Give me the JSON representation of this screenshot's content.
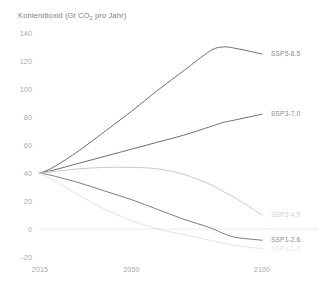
{
  "chart_data": {
    "type": "line",
    "title": "Kohlendioxid (Gt CO2 pro Jahr)",
    "title_main": "Kohlendioxid (Gt CO",
    "title_sub": "2",
    "title_tail": " pro Jahr)",
    "xlabel": "",
    "ylabel": "",
    "xlim": [
      2015,
      2100
    ],
    "ylim": [
      -20,
      140
    ],
    "grid": "horizontal-zero-line-only",
    "legend_position": "right-inline-labels",
    "x_ticks": [
      "2015",
      "2050",
      "2100"
    ],
    "x_tick_values": [
      2015,
      2050,
      2100
    ],
    "y_ticks": [
      "140",
      "120",
      "100",
      "80",
      "60",
      "40",
      "20",
      "0",
      "-20"
    ],
    "y_tick_values": [
      140,
      120,
      100,
      80,
      60,
      40,
      20,
      0,
      -20
    ],
    "x": [
      2015,
      2020,
      2030,
      2040,
      2050,
      2060,
      2070,
      2080,
      2085,
      2090,
      2100
    ],
    "series": [
      {
        "name": "SSP5-8.5",
        "color": "#6e6e6e",
        "label_color": "#8a8a8a",
        "values": [
          40,
          44,
          56,
          70,
          84,
          99,
          113,
          127,
          130,
          129,
          125
        ]
      },
      {
        "name": "SSP3-7.0",
        "color": "#6e6e6e",
        "label_color": "#8a8a8a",
        "values": [
          40,
          42,
          47,
          52,
          57,
          62,
          67,
          73,
          76,
          78,
          82
        ]
      },
      {
        "name": "SSP2-4.5",
        "color": "#c9c9c9",
        "label_color": "#cfcfcf",
        "values": [
          40,
          41,
          43,
          44,
          44,
          43,
          39,
          32,
          27,
          22,
          10
        ]
      },
      {
        "name": "SSP1-2.6",
        "color": "#7d7d7d",
        "label_color": "#8a8a8a",
        "values": [
          40,
          38,
          33,
          27,
          21,
          14,
          7,
          1,
          -3,
          -6,
          -8
        ]
      },
      {
        "name": "SSP1-1.9",
        "color": "#e2e2e2",
        "label_color": "#e6e6e6",
        "values": [
          40,
          35,
          24,
          14,
          6,
          0,
          -4,
          -8,
          -10,
          -12,
          -14
        ]
      }
    ],
    "zero_line": {
      "value": 0,
      "color": "#eaeaea"
    }
  }
}
